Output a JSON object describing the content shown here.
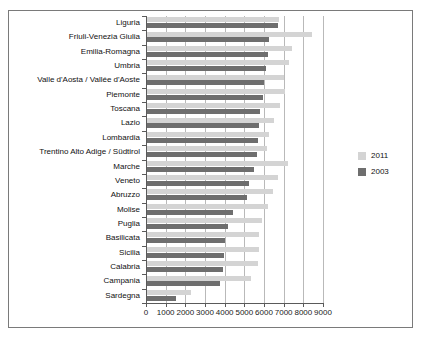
{
  "chart_data": {
    "type": "bar",
    "orientation": "horizontal",
    "title": "",
    "xlabel": "",
    "ylabel": "",
    "xlim": [
      0,
      9000
    ],
    "xticks": [
      0,
      1000,
      2000,
      3000,
      4000,
      5000,
      6000,
      7000,
      8000,
      9000
    ],
    "xtick_labels": [
      "0",
      "1000",
      "2000",
      "3000",
      "4000",
      "5000",
      "6000",
      "7000",
      "8000",
      "9000"
    ],
    "grid": true,
    "grid_axis": "x",
    "legend_position": "right",
    "categories": [
      "Liguria",
      "Friuli-Venezia Giulia",
      "Emilia-Romagna",
      "Umbria",
      "Valle d'Aosta / Vallée d'Aoste",
      "Piemonte",
      "Toscana",
      "Lazio",
      "Lombardia",
      "Trentino Alto Adige / Südtirol",
      "Marche",
      "Veneto",
      "Abruzzo",
      "Molise",
      "Puglia",
      "Basilicata",
      "Sicilia",
      "Calabria",
      "Campania",
      "Sardegna"
    ],
    "series": [
      {
        "name": "2011",
        "color": "#d4d4d4",
        "values": [
          6750,
          8450,
          7400,
          7250,
          7000,
          7050,
          6800,
          6500,
          6250,
          6150,
          7200,
          6700,
          6450,
          6200,
          5900,
          5750,
          5750,
          5700,
          5350,
          2300
        ]
      },
      {
        "name": "2003",
        "color": "#6e6e6e",
        "values": [
          6700,
          6250,
          6200,
          6100,
          6000,
          5950,
          5800,
          5750,
          5700,
          5650,
          5500,
          5250,
          5150,
          4400,
          4150,
          4000,
          3950,
          3900,
          3750,
          1500
        ]
      }
    ]
  },
  "legend": {
    "items": [
      {
        "label": "2011",
        "color": "#d4d4d4"
      },
      {
        "label": "2003",
        "color": "#6e6e6e"
      }
    ]
  }
}
